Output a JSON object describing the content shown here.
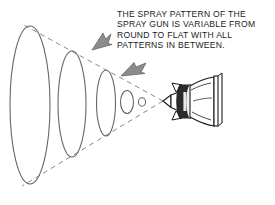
{
  "diagram": {
    "background_color": "#ffffff",
    "caption": {
      "lines": [
        "THE SPRAY PATTERN OF THE",
        "SPRAY GUN IS VARIABLE FROM",
        "ROUND TO FLAT WITH ALL",
        "PATTERNS IN BETWEEN."
      ],
      "text_color": "#1a1a1a",
      "align": "left"
    },
    "colors": {
      "outline": "#666666",
      "dashed_guide": "#8a8a8a",
      "arrow_fill": "#8c8c8c",
      "arrow_stroke": "#5a5a5a",
      "gun_outline": "#1a1a1a",
      "gun_collar_dark": "#2b2b2b",
      "gun_body_fill": "#ffffff"
    },
    "spray_cone": {
      "description": "Dashed guide lines diverging from the spray gun nozzle tip to the largest spray pattern",
      "apex": {
        "x": 163,
        "y": 101
      },
      "upper_end": {
        "x": 22,
        "y": 24
      },
      "lower_end": {
        "x": 22,
        "y": 186
      },
      "dash_pattern": "5,4"
    },
    "spray_patterns": [
      {
        "name": "pattern-largest",
        "cx": 30,
        "cy": 105,
        "rx": 20,
        "ry": 79,
        "order": 1
      },
      {
        "name": "pattern-large",
        "cx": 72,
        "cy": 104,
        "rx": 14,
        "ry": 53,
        "order": 2
      },
      {
        "name": "pattern-medium",
        "cx": 106,
        "cy": 103,
        "rx": 9.5,
        "ry": 33,
        "order": 3
      },
      {
        "name": "pattern-small",
        "cx": 127,
        "cy": 102,
        "rx": 6.5,
        "ry": 11.5,
        "order": 4
      },
      {
        "name": "pattern-round",
        "cx": 142,
        "cy": 102,
        "rx": 3.6,
        "ry": 4.2,
        "order": 5
      }
    ],
    "arrows": [
      {
        "name": "arrow-upper",
        "direction": "down-left",
        "tip": {
          "x": 92,
          "y": 48
        },
        "tail": {
          "x": 111,
          "y": 33
        }
      },
      {
        "name": "arrow-lower",
        "direction": "down-left",
        "tip": {
          "x": 122,
          "y": 76
        },
        "tail": {
          "x": 146,
          "y": 63
        }
      }
    ],
    "spray_gun": {
      "name": "spray-gun",
      "nozzle_tip": {
        "x": 163,
        "y": 101
      },
      "collar": {
        "x": 178,
        "y": 86,
        "width": 10,
        "height": 32
      },
      "body_end": {
        "x": 224,
        "y": 101
      },
      "orientation": "pointing-left"
    }
  }
}
